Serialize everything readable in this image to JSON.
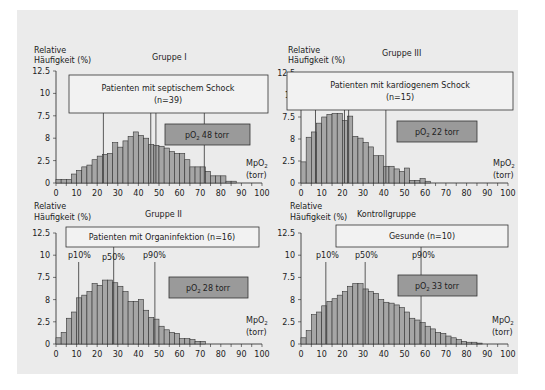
{
  "figure": {
    "background": "#ebebeb",
    "bar_fill": "#a6a6a6",
    "bar_stroke": "#333333",
    "label_box_fill": "#f2f2f2",
    "po2_box_fill": "#9a9a9a",
    "y_axis_label_line1": "Relative",
    "y_axis_label_line2": "Häufigkeit (%)",
    "x_axis_label_line1": "MpO",
    "x_axis_label_sub": "2",
    "x_axis_label_line2": "(torr)",
    "y_tick_labels": [
      "0",
      "2.5",
      "8",
      "7.5",
      "10",
      "12.5"
    ],
    "x_tick_labels": [
      "0",
      "10",
      "20",
      "30",
      "40",
      "50",
      "60",
      "70",
      "80",
      "90",
      "100"
    ]
  },
  "chart_data": [
    {
      "type": "bar",
      "title": "Gruppe I",
      "box_text_line1": "Patienten mit septischem Schock",
      "box_text_line2": "(n=39)",
      "po2_label": "pO",
      "po2_sub": "2",
      "po2_value": "48 torr",
      "xlabel": "MpO2 (torr)",
      "ylabel": "Relative Häufigkeit (%)",
      "xlim": [
        0,
        100
      ],
      "ylim": [
        0,
        12.5
      ],
      "bin_width": 2.5,
      "percentile_lines": [
        23,
        46,
        48.5,
        72
      ],
      "values": [
        0.4,
        0.4,
        0.4,
        1.0,
        1.4,
        1.8,
        2.0,
        2.6,
        3.0,
        3.2,
        3.3,
        4.5,
        4.0,
        4.7,
        5.2,
        5.7,
        5.3,
        5.0,
        4.3,
        4.2,
        4.1,
        3.9,
        3.5,
        3.3,
        3.3,
        2.6,
        1.8,
        1.8,
        1.8,
        1.3,
        0.8,
        0.8,
        0.8,
        0.2,
        0.2,
        0,
        0,
        0,
        0,
        0
      ]
    },
    {
      "type": "bar",
      "title": "Gruppe III",
      "box_text_line1": "Patienten mit kardiogenem Schock",
      "box_text_line2": "(n=15)",
      "po2_label": "pO",
      "po2_sub": "2",
      "po2_value": "22 torr",
      "xlabel": "MpO2 (torr)",
      "ylabel": "Relative Häufigkeit (%)",
      "xlim": [
        0,
        100
      ],
      "ylim": [
        0,
        12.5
      ],
      "bin_width": 2.5,
      "percentile_lines": [
        7,
        21,
        23,
        41
      ],
      "values": [
        2.4,
        5.2,
        5.8,
        6.8,
        7.5,
        7.8,
        7.9,
        7.9,
        7.1,
        7.6,
        5.3,
        5.1,
        4.6,
        4.1,
        3.1,
        3.1,
        1.9,
        1.9,
        1.6,
        1.3,
        1.7,
        0.3,
        0.3,
        0.5,
        0.2,
        0,
        0,
        0,
        0,
        0,
        0,
        0,
        0,
        0,
        0,
        0,
        0,
        0,
        0,
        0
      ]
    },
    {
      "type": "bar",
      "title": "Gruppe II",
      "box_text_line1": "Patienten mit Organinfektion (n=16)",
      "po2_label": "pO",
      "po2_sub": "2",
      "po2_value": "28 torr",
      "percentile_labels": [
        "p10%",
        "p50%",
        "p90%"
      ],
      "percentile_lines": [
        11,
        28,
        48
      ],
      "xlabel": "MpO2 (torr)",
      "ylabel": "Relative Häufigkeit (%)",
      "xlim": [
        0,
        100
      ],
      "ylim": [
        0,
        12.5
      ],
      "bin_width": 2.5,
      "values": [
        0.7,
        1.3,
        2.9,
        3.6,
        5.2,
        5.5,
        5.9,
        6.8,
        6.6,
        7.2,
        7.2,
        6.9,
        6.5,
        5.9,
        4.8,
        4.8,
        5.0,
        3.8,
        3.0,
        2.8,
        2.0,
        1.6,
        1.3,
        1.2,
        0.6,
        0.6,
        0.5,
        0.3,
        0.3,
        0,
        0,
        0,
        0,
        0,
        0,
        0,
        0,
        0,
        0,
        0
      ]
    },
    {
      "type": "bar",
      "title": "Kontrollgruppe",
      "box_text_line1": "Gesunde (n=10)",
      "po2_label": "pO",
      "po2_sub": "2",
      "po2_value": "33 torr",
      "percentile_labels": [
        "p10%",
        "p50%",
        "p90%"
      ],
      "percentile_lines": [
        12,
        31,
        58
      ],
      "xlabel": "MpO2 (torr)",
      "ylabel": "Relative Häufigkeit (%)",
      "xlim": [
        0,
        100
      ],
      "ylim": [
        0,
        12.5
      ],
      "bin_width": 2.5,
      "values": [
        0.7,
        1.5,
        3.3,
        3.6,
        4.3,
        4.8,
        5.1,
        5.5,
        5.9,
        6.5,
        6.8,
        6.8,
        6.2,
        5.9,
        5.7,
        5.0,
        4.7,
        4.6,
        4.4,
        4.1,
        3.6,
        2.9,
        2.7,
        2.4,
        2.0,
        1.7,
        1.3,
        1.2,
        0.9,
        0.7,
        0.5,
        0.3,
        0.2,
        0.2,
        0.1,
        0,
        0,
        0,
        0,
        0
      ]
    }
  ]
}
